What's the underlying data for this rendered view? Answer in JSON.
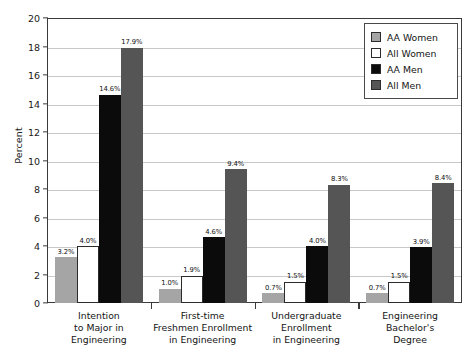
{
  "chart_data": {
    "type": "bar",
    "title": "",
    "subtitle": "",
    "xlabel": "",
    "ylabel": "Percent",
    "ylim": [
      0,
      20
    ],
    "ytick_step": 2,
    "yticks": [
      "20",
      "18",
      "16",
      "14",
      "12",
      "10",
      "8",
      "6",
      "4",
      "2",
      "0"
    ],
    "grid": true,
    "legend_position": "top-right",
    "value_suffix": "%",
    "categories": [
      "Intention\nto Major in\nEngineering",
      "First-time\nFreshmen Enrollment\nin Engineering",
      "Undergraduate\nEnrollment\nin Engineering",
      "Engineering\nBachelor's\nDegree"
    ],
    "category_lines": [
      [
        "Intention",
        "to Major in",
        "Engineering"
      ],
      [
        "First-time",
        "Freshmen Enrollment",
        "in Engineering"
      ],
      [
        "Undergraduate",
        "Enrollment",
        "in Engineering"
      ],
      [
        "Engineering",
        "Bachelor's",
        "Degree"
      ]
    ],
    "series": [
      {
        "name": "AA Women",
        "color": "#a5a5a5",
        "values": [
          3.2,
          1.0,
          0.7,
          0.7
        ],
        "labels": [
          "3.2%",
          "1.0%",
          "0.7%",
          "0.7%"
        ]
      },
      {
        "name": "All Women",
        "color": "#ffffff",
        "values": [
          4.0,
          1.9,
          1.5,
          1.5
        ],
        "labels": [
          "4.0%",
          "1.9%",
          "1.5%",
          "1.5%"
        ]
      },
      {
        "name": "AA Men",
        "color": "#0b0b0b",
        "values": [
          14.6,
          4.6,
          4.0,
          3.9
        ],
        "labels": [
          "14.6%",
          "4.6%",
          "4.0%",
          "3.9%"
        ]
      },
      {
        "name": "All Men",
        "color": "#555555",
        "values": [
          17.9,
          9.4,
          8.3,
          8.4
        ],
        "labels": [
          "17.9%",
          "9.4%",
          "8.3%",
          "8.4%"
        ]
      }
    ]
  },
  "legend": {
    "items": [
      {
        "label": "AA Women"
      },
      {
        "label": "All Women"
      },
      {
        "label": "AA Men"
      },
      {
        "label": "All Men"
      }
    ]
  }
}
